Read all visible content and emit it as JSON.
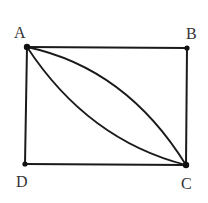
{
  "diagram": {
    "type": "geometry-figure",
    "points": [
      {
        "id": "A",
        "label": "A"
      },
      {
        "id": "B",
        "label": "B"
      },
      {
        "id": "C",
        "label": "C"
      },
      {
        "id": "D",
        "label": "D"
      }
    ],
    "segments": [
      {
        "from": "A",
        "to": "B"
      },
      {
        "from": "B",
        "to": "C"
      },
      {
        "from": "C",
        "to": "D"
      },
      {
        "from": "D",
        "to": "A"
      }
    ],
    "arcs": [
      {
        "from": "A",
        "to": "C",
        "bulge_toward": "B"
      },
      {
        "from": "A",
        "to": "C",
        "bulge_toward": "D"
      }
    ],
    "colors": {
      "line": "#1a1a1a",
      "label": "#333333",
      "background": "#ffffff"
    }
  }
}
